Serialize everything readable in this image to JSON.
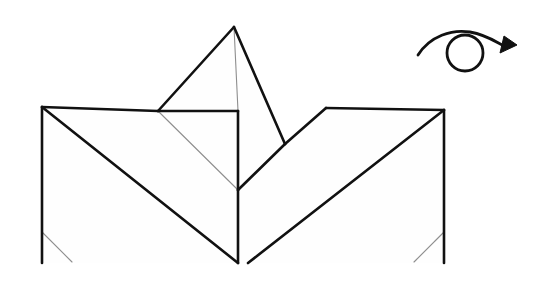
{
  "figure": {
    "canvas": {
      "width": 549,
      "height": 285,
      "background": "#ffffff"
    },
    "colors": {
      "edge_main": "#111111",
      "edge_thin": "#8e8e8e",
      "face_fill": "#fefefe",
      "paper": "#ffffff"
    },
    "line_weights": {
      "main": 2.6,
      "thin": 1.1,
      "arrow": 2.8
    },
    "model": {
      "name": "folded-paper-model",
      "vertices": {
        "apex": [
          234,
          27
        ],
        "left_top_corner": [
          42,
          107
        ],
        "left_shoulder": [
          158,
          111
        ],
        "center_top": [
          238,
          111
        ],
        "center_vertex": [
          238,
          190
        ],
        "center_bottom": [
          238,
          263
        ],
        "left_bottom": [
          42,
          263
        ],
        "valley_low_right": [
          285,
          144
        ],
        "right_shoulder": [
          326,
          108
        ],
        "right_top_corner": [
          444,
          110
        ],
        "right_bottom": [
          444,
          263
        ],
        "left_crease_end": [
          72,
          262
        ],
        "left_crease_start": [
          42,
          232
        ],
        "right_crease_start": [
          444,
          232
        ],
        "right_crease_end": [
          414,
          262
        ]
      },
      "faces": [
        {
          "name": "apex-left-panel",
          "points": "234,27 158,111 238,190 238,111"
        },
        {
          "name": "apex-right-panel",
          "points": "234,27 285,144 238,190 238,111"
        }
      ],
      "main_edges": [
        {
          "name": "top-left-horizontal",
          "points": "42,107 158,111"
        },
        {
          "name": "apex-left-edge",
          "points": "158,111 234,27"
        },
        {
          "name": "apex-right-edge",
          "points": "234,27 285,144"
        },
        {
          "name": "shoulder-left-horizontal",
          "points": "158,111 238,111"
        },
        {
          "name": "center-vertical-upper",
          "points": "238,111 238,190"
        },
        {
          "name": "center-vertical-lower",
          "points": "238,190 238,263"
        },
        {
          "name": "left-outer-vertical",
          "points": "42,107 42,263"
        },
        {
          "name": "left-big-diagonal",
          "points": "42,107 238,263"
        },
        {
          "name": "valley-diagonal",
          "points": "238,190 285,144"
        },
        {
          "name": "right-shoulder-diagonal",
          "points": "285,144 326,108"
        },
        {
          "name": "top-right-horizontal",
          "points": "326,108 444,110"
        },
        {
          "name": "right-outer-vertical",
          "points": "444,110 444,263"
        },
        {
          "name": "right-big-diagonal",
          "points": "444,110 248,263"
        }
      ],
      "thin_edges": [
        {
          "name": "apex-center-crease",
          "points": "234,27 238,111"
        },
        {
          "name": "shoulder-to-center-crease",
          "points": "158,111 238,190"
        },
        {
          "name": "left-bottom-crease",
          "points": "42,232 72,262"
        },
        {
          "name": "right-bottom-crease",
          "points": "444,232 414,262"
        }
      ]
    },
    "turnover_symbol": {
      "name": "turn-over-arrow",
      "meaning": "turn the model over",
      "circle": {
        "cx": 465,
        "cy": 53,
        "r": 18
      },
      "arc_path": "M 418 55 C 430 36 452 29 470 32 C 487 35 496 42 504 46",
      "arrow_head": "504,36 517,45 500,53"
    }
  }
}
